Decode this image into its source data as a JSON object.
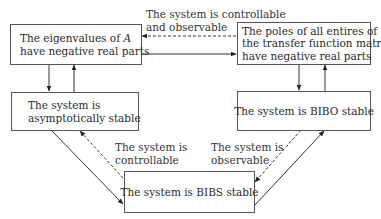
{
  "diagram": {
    "type": "stability-relations",
    "nodes": [
      {
        "id": "eigen",
        "lines": [
          "The eigenvalues of A",
          "have negative real parts"
        ]
      },
      {
        "id": "poles",
        "lines": [
          "The poles of all entires of",
          "the transfer function matrix",
          "have negative real parts"
        ]
      },
      {
        "id": "asymp",
        "lines": [
          "The system is",
          "asymptotically stable"
        ]
      },
      {
        "id": "bibo",
        "lines": [
          "The system is BIBO stable"
        ]
      },
      {
        "id": "bibs",
        "lines": [
          "The system is BIBS stable"
        ]
      }
    ],
    "edge_labels": {
      "top": [
        "The system is controllable",
        "and observable"
      ],
      "left": [
        "The system is",
        "controllable"
      ],
      "right": [
        "The system is",
        "observable"
      ]
    },
    "edges": [
      {
        "from": "eigen",
        "to": "poles",
        "style": "solid"
      },
      {
        "from": "poles",
        "to": "eigen",
        "style": "dashed",
        "condition": "controllable and observable"
      },
      {
        "from": "eigen",
        "to": "asymp",
        "style": "solid"
      },
      {
        "from": "asymp",
        "to": "eigen",
        "style": "solid"
      },
      {
        "from": "poles",
        "to": "bibo",
        "style": "solid"
      },
      {
        "from": "bibo",
        "to": "poles",
        "style": "solid"
      },
      {
        "from": "asymp",
        "to": "bibs",
        "style": "solid"
      },
      {
        "from": "bibs",
        "to": "asymp",
        "style": "dashed",
        "condition": "controllable"
      },
      {
        "from": "bibs",
        "to": "bibo",
        "style": "solid"
      },
      {
        "from": "bibo",
        "to": "bibs",
        "style": "dashed",
        "condition": "observable"
      }
    ],
    "colors": {
      "line": "#333333",
      "text": "#2a2a2a"
    }
  }
}
